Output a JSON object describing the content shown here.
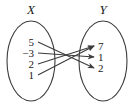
{
  "figure": {
    "type": "mapping-diagram",
    "domain_set": {
      "label": "X",
      "elements": [
        "5",
        "−3",
        "2",
        "1"
      ]
    },
    "codomain_set": {
      "label": "Y",
      "elements": [
        "7",
        "1",
        "2"
      ]
    },
    "arrows": [
      {
        "from": "5",
        "to": "2"
      },
      {
        "from": "−3",
        "to": "1"
      },
      {
        "from": "2",
        "to": "7"
      },
      {
        "from": "1",
        "to": "7"
      }
    ],
    "colors": {
      "stroke": "#3c3c3c",
      "text": "#1a1a1a",
      "background": "#ffffff"
    }
  }
}
